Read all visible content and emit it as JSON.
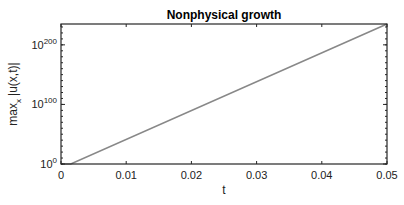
{
  "chart_data": {
    "type": "line",
    "title": "Nonphysical growth",
    "xlabel": "t",
    "ylabel": "max_x |u(x,t)|",
    "ylabel_main": "max",
    "ylabel_sub": "x",
    "ylabel_rest": "|u(x,t)|",
    "yscale": "log",
    "xlim": [
      0,
      0.05
    ],
    "ylim_log10": [
      0,
      235
    ],
    "grid": false,
    "legend": null,
    "x_ticks": [
      {
        "value": 0,
        "label": "0"
      },
      {
        "value": 0.01,
        "label": "0.01"
      },
      {
        "value": 0.02,
        "label": "0.02"
      },
      {
        "value": 0.03,
        "label": "0.03"
      },
      {
        "value": 0.04,
        "label": "0.04"
      },
      {
        "value": 0.05,
        "label": "0.05"
      }
    ],
    "y_ticks": [
      {
        "log10": 0,
        "base": "10",
        "exp": "0"
      },
      {
        "log10": 100,
        "base": "10",
        "exp": "100"
      },
      {
        "log10": 200,
        "base": "10",
        "exp": "200"
      }
    ],
    "series": [
      {
        "name": "max |u|",
        "color": "#888888",
        "x": [
          0,
          0.0015,
          0.05
        ],
        "log10_y": [
          0,
          0,
          235
        ]
      }
    ]
  }
}
